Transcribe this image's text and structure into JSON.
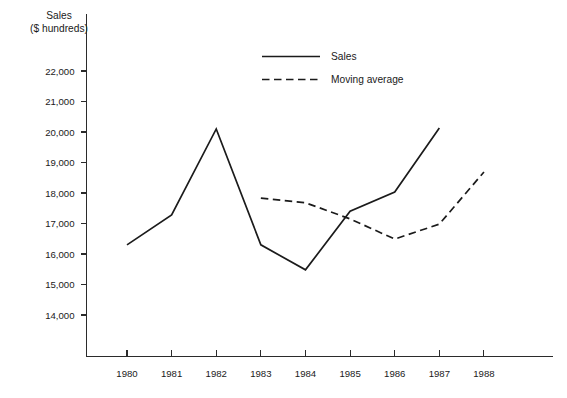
{
  "chart_data": {
    "type": "line",
    "title": "",
    "subtitle": "",
    "xlabel": "",
    "ylabel": "Sales",
    "ylabel_line2": "($ hundreds)",
    "x": [
      1980,
      1981,
      1982,
      1983,
      1984,
      1985,
      1986,
      1987,
      1988
    ],
    "categories": [
      "1980",
      "1981",
      "1982",
      "1983",
      "1984",
      "1985",
      "1986",
      "1987",
      "1988"
    ],
    "xtick_labels": [
      "1980",
      "1981",
      "1982",
      "1983",
      "1984",
      "1985",
      "1986",
      "1987",
      "1988"
    ],
    "ytick_labels": [
      "14,000",
      "15,000",
      "16,000",
      "17,000",
      "18,000",
      "19,000",
      "20,000",
      "21,000",
      "22,000"
    ],
    "ytick_values": [
      14000,
      15000,
      16000,
      17000,
      18000,
      19000,
      20000,
      21000,
      22000
    ],
    "ylim": [
      13500,
      22600
    ],
    "xlim": [
      1979.5,
      1988.8
    ],
    "grid": false,
    "legend_position": "top-center",
    "series": [
      {
        "name": "Sales",
        "style": "solid",
        "color": "#1b1b1b",
        "x": [
          1980,
          1981,
          1982,
          1983,
          1984,
          1985,
          1986,
          1987
        ],
        "values": [
          16300,
          17280,
          20100,
          16300,
          15480,
          17400,
          18030,
          20130
        ]
      },
      {
        "name": "Moving average",
        "style": "dashed",
        "color": "#1b1b1b",
        "x": [
          1983,
          1984,
          1985,
          1986,
          1987,
          1988
        ],
        "values": [
          17830,
          17680,
          17150,
          16490,
          16980,
          18690
        ]
      }
    ],
    "legend": [
      {
        "label": "Sales",
        "style": "solid"
      },
      {
        "label": "Moving average",
        "style": "dashed"
      }
    ]
  },
  "axis": {
    "y_title_line1": "Sales",
    "y_title_line2": "($ hundreds)"
  }
}
